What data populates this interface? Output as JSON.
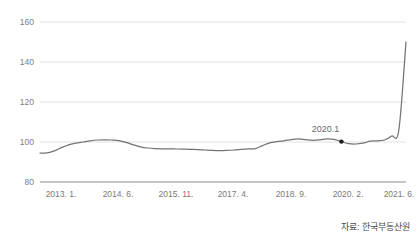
{
  "chart_data": {
    "type": "line",
    "title": "",
    "subtitle": "",
    "xlabel": "",
    "ylabel": "",
    "ylim": [
      80,
      160
    ],
    "yticks": [
      80,
      100,
      120,
      140,
      160
    ],
    "grid": true,
    "legend": null,
    "xtick_labels": [
      "2013. 1.",
      "2014. 6.",
      "2015. 11.",
      "2017. 4.",
      "2018. 9.",
      "2020. 2.",
      "2021. 6."
    ],
    "series": [
      {
        "name": "주택가격지수",
        "color": "#737373",
        "x": [
          "2013.01",
          "2013.03",
          "2013.05",
          "2013.07",
          "2013.09",
          "2013.11",
          "2014.01",
          "2014.03",
          "2014.05",
          "2014.07",
          "2014.09",
          "2014.11",
          "2015.01",
          "2015.03",
          "2015.05",
          "2015.07",
          "2015.09",
          "2015.11",
          "2016.01",
          "2016.03",
          "2016.05",
          "2016.07",
          "2016.09",
          "2016.11",
          "2017.01",
          "2017.03",
          "2017.05",
          "2017.07",
          "2017.09",
          "2017.11",
          "2018.01",
          "2018.03",
          "2018.05",
          "2018.07",
          "2018.09",
          "2018.11",
          "2019.01",
          "2019.03",
          "2019.05",
          "2019.07",
          "2019.09",
          "2019.11",
          "2020.01",
          "2020.03",
          "2020.05",
          "2020.07",
          "2020.09",
          "2020.11",
          "2021.01",
          "2021.03",
          "2021.05",
          "2021.06"
        ],
        "values": [
          94.4,
          94.6,
          95.6,
          97.2,
          98.6,
          99.4,
          100.0,
          100.6,
          101.0,
          101.1,
          101.0,
          100.7,
          99.8,
          98.6,
          97.6,
          97.0,
          96.7,
          96.6,
          96.6,
          96.5,
          96.4,
          96.3,
          96.2,
          96.0,
          95.8,
          95.7,
          95.8,
          96.0,
          96.3,
          96.6,
          96.7,
          98.2,
          99.6,
          100.2,
          100.6,
          101.2,
          101.6,
          101.2,
          100.8,
          101.1,
          101.6,
          101.3,
          100.2,
          99.2,
          99.0,
          99.4,
          100.4,
          100.6,
          101.0,
          103.0,
          106.0,
          150.0
        ],
        "start_value": 94.4,
        "end_value": 150.0,
        "min_value": 94.4,
        "max_value": 150.0
      }
    ],
    "annotations": [
      {
        "label": "2020.1",
        "x": "2020.01",
        "y": 100.4,
        "marker": "dot",
        "marker_color": "#1a1a1a"
      }
    ],
    "source_note": "자료: 한국부동산원"
  },
  "axis": {
    "y_labels": [
      "160",
      "140",
      "120",
      "100",
      "80"
    ],
    "x_labels": [
      "2013. 1.",
      "2014. 6.",
      "2015. 11.",
      "2017. 4.",
      "2018. 9.",
      "2020. 2.",
      "2021. 6."
    ]
  },
  "annotation": {
    "label": "2020.1"
  },
  "footer": {
    "source": "자료: 한국부동산원"
  },
  "colors": {
    "line": "#737373",
    "grid": "#d9d9d9",
    "axis": "#8c8c8c",
    "marker": "#1a1a1a",
    "tick_text": "#808080",
    "background": "#ffffff"
  }
}
